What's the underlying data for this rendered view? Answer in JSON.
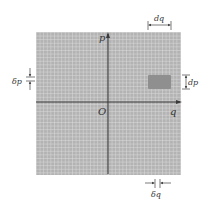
{
  "diagram": {
    "type": "phase-space grid",
    "axes": {
      "horizontal_label": "q",
      "vertical_label": "p",
      "origin_label": "O"
    },
    "annotations": {
      "dq": "dq",
      "dp": "dp",
      "delta_p": "δp",
      "delta_q": "δq"
    },
    "colors": {
      "grid_background": "#b3b3b3",
      "grid_lines": "#e2e2e2",
      "axis": "#3a3a3a",
      "cell_highlight": "#8f8f8f",
      "annotation": "#444444"
    }
  }
}
